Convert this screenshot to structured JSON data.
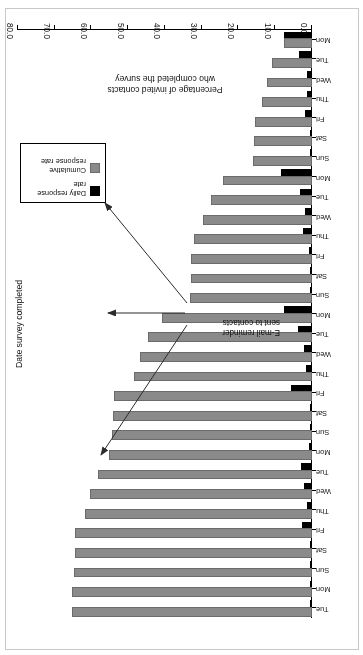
{
  "figure": {
    "kind": "statistical-bar-chart",
    "annotation": {
      "line1": "E-mail reminder",
      "line2": "sent to contacts",
      "arrow_count": 3
    },
    "legend": {
      "items": [
        {
          "label_line1": "Daily response",
          "label_line2": "rate",
          "color": "#000000",
          "swatch": "black-square"
        },
        {
          "label_line1": "Cumulative",
          "label_line2": "response rate",
          "color": "#8a8a8a",
          "swatch": "grey-square"
        }
      ]
    }
  },
  "chart_data": {
    "type": "bar",
    "orientation": "horizontal",
    "title": "",
    "xlabel": "Percentage of invited contacts who completed the survey",
    "xlabel_line1": "Percentage of invited contacts",
    "xlabel_line2": "who completed the survey",
    "ylabel": "Date survey completed",
    "xlim": [
      0,
      80
    ],
    "xticks": [
      "0.0",
      "10.0",
      "20.0",
      "30.0",
      "40.0",
      "50.0",
      "60.0",
      "70.0",
      "80.0"
    ],
    "xtick_values": [
      0,
      10,
      20,
      30,
      40,
      50,
      60,
      70,
      80
    ],
    "grid": false,
    "legend_position": "bottom-left",
    "categories": [
      "Mon",
      "Tue",
      "Wed",
      "Thu",
      "Fri",
      "Sat",
      "Sun",
      "Mon",
      "Tue",
      "Wed",
      "Thu",
      "Fri",
      "Sat",
      "Sun",
      "Mon",
      "Tue",
      "Wed",
      "Thu",
      "Fri",
      "Sat",
      "Sun",
      "Mon",
      "Tue",
      "Wed",
      "Thu",
      "Fri",
      "Sat",
      "Sun",
      "Mon",
      "Tue"
    ],
    "series": [
      {
        "name": "Cumulative response rate",
        "color": "#8a8a8a",
        "values": [
          7.5,
          11.0,
          12.3,
          13.7,
          15.5,
          15.8,
          16.0,
          24.3,
          27.6,
          29.6,
          32.0,
          32.8,
          33.0,
          33.2,
          40.7,
          44.5,
          46.7,
          48.3,
          54.0,
          54.2,
          54.5,
          55.2,
          58.2,
          60.3,
          61.7,
          64.5,
          64.6,
          64.8,
          65.2,
          65.4
        ]
      },
      {
        "name": "Daily response rate",
        "color": "#000000",
        "values": [
          7.5,
          3.5,
          1.3,
          1.4,
          1.8,
          0.3,
          0.2,
          8.3,
          3.3,
          2.0,
          2.4,
          0.8,
          0.2,
          0.2,
          7.5,
          3.8,
          2.2,
          1.6,
          5.7,
          0.2,
          0.3,
          0.7,
          3.0,
          2.1,
          1.4,
          2.8,
          0.1,
          0.2,
          0.4,
          0.2
        ]
      }
    ]
  }
}
